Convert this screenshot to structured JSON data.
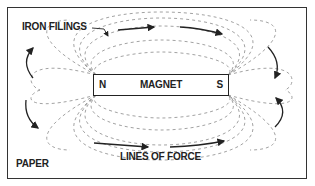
{
  "diagram": {
    "labels": {
      "iron_filings": "IRON FILINGS",
      "magnet": "MAGNET",
      "north_pole": "N",
      "south_pole": "S",
      "lines_of_force": "LINES OF FORCE",
      "paper": "PAPER"
    },
    "colors": {
      "ink": "#222222",
      "dashes": "#8a8a8a",
      "background": "#ffffff"
    },
    "arrows": [
      {
        "position": "top-center",
        "direction": "right"
      },
      {
        "position": "top-right",
        "direction": "right"
      },
      {
        "position": "right-top",
        "direction": "down"
      },
      {
        "position": "right-bottom",
        "direction": "up"
      },
      {
        "position": "bottom-center",
        "direction": "right"
      },
      {
        "position": "bottom-right",
        "direction": "right"
      },
      {
        "position": "left-top",
        "direction": "up"
      },
      {
        "position": "left-bottom",
        "direction": "down"
      }
    ]
  }
}
